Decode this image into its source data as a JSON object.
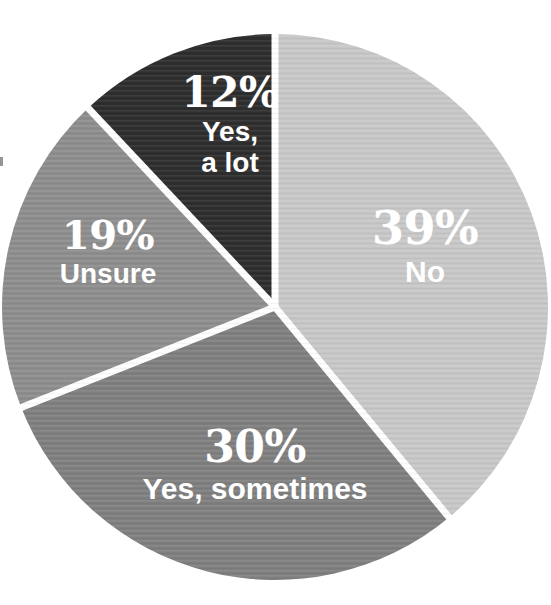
{
  "chart_data": {
    "type": "pie",
    "title": "",
    "subtitle": "",
    "xlabel": "",
    "ylabel": "",
    "legend_position": "none",
    "grid": false,
    "labels_inside_slices": true,
    "start_angle_deg": 0,
    "direction": "clockwise",
    "categories": [
      "No",
      "Yes, sometimes",
      "Unsure",
      "Yes, a lot"
    ],
    "values": [
      39,
      30,
      19,
      12
    ],
    "units": "%",
    "slices": [
      {
        "name": "No",
        "value": 39,
        "pct_text": "39%",
        "label": "No",
        "color": "#c8c8c8",
        "start_deg": 0,
        "end_deg": 140.4
      },
      {
        "name": "Yes, sometimes",
        "value": 30,
        "pct_text": "30%",
        "label": "Yes, sometimes",
        "color": "#808080",
        "start_deg": 140.4,
        "end_deg": 248.4
      },
      {
        "name": "Unsure",
        "value": 19,
        "pct_text": "19%",
        "label": "Unsure",
        "color": "#8e8e8e",
        "start_deg": 248.4,
        "end_deg": 316.8
      },
      {
        "name": "Yes, a lot",
        "value": 12,
        "pct_text": "12%",
        "label": "Yes, a lot",
        "color": "#2e2e2e",
        "start_deg": 316.8,
        "end_deg": 360
      }
    ]
  },
  "chart": {
    "background_color": "#ffffff",
    "separator_color": "#ffffff",
    "label_text_color": "#ffffff"
  },
  "labels": {
    "no": {
      "pct": "39%",
      "name": "No"
    },
    "yes_sometimes": {
      "pct": "30%",
      "name": "Yes, sometimes"
    },
    "unsure": {
      "pct": "19%",
      "name": "Unsure"
    },
    "yes_a_lot": {
      "pct": "12%",
      "name_line1": "Yes,",
      "name_line2": "a lot"
    }
  }
}
